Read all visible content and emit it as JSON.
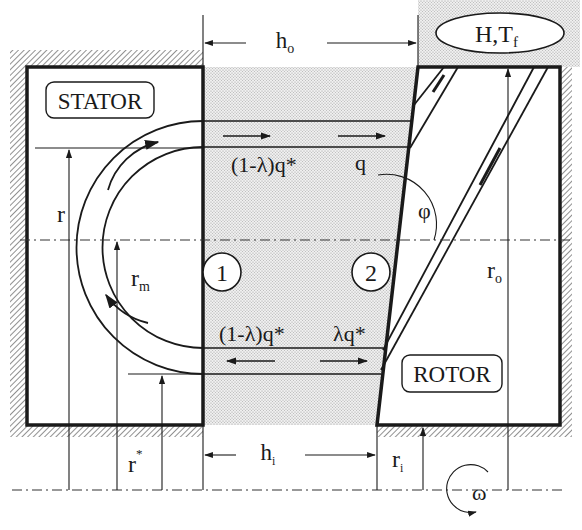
{
  "diagram": {
    "components": {
      "stator_label": "STATOR",
      "rotor_label": "ROTOR",
      "reservoir_label": "H,T",
      "reservoir_sub": "f"
    },
    "dimensions": {
      "h_outer": "h",
      "h_outer_sub": "o",
      "h_inner": "h",
      "h_inner_sub": "i",
      "r": "r",
      "r_m": "r",
      "r_m_sub": "m",
      "r_star": "r",
      "r_star_sup": "*",
      "r_i": "r",
      "r_i_sub": "i",
      "r_o": "r",
      "r_o_sub": "o",
      "phi": "φ",
      "omega": "ω"
    },
    "stations": {
      "station_1": "1",
      "station_2": "2"
    },
    "flows": {
      "upper_left": "(1-λ)q*",
      "upper_right": "q",
      "lower_left": "(1-λ)q*",
      "lower_right": "λq*"
    },
    "colors": {
      "line": "#1a1a1a",
      "fluid_fill": "#e4e4e4",
      "hatch": "#555555",
      "background": "#ffffff"
    }
  }
}
